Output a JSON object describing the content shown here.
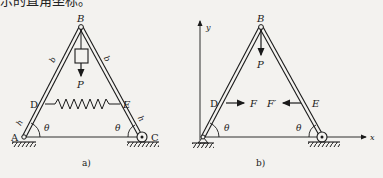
{
  "header_text": "示的直角坐标。",
  "figure_a": {
    "caption": "a)",
    "points": {
      "A": "A",
      "B": "B",
      "C": "C",
      "D": "D",
      "E": "E"
    },
    "bar_length_upper": "b",
    "bar_length_lower": "h",
    "angle": "θ",
    "load": "P"
  },
  "figure_b": {
    "caption": "b)",
    "points": {
      "B": "B",
      "D": "D",
      "E": "E"
    },
    "axis_x": "x",
    "axis_y": "y",
    "angle": "θ",
    "load": "P",
    "force_left": "F",
    "force_right": "F′"
  },
  "colors": {
    "ink": "#1a1a1a",
    "paper": "#f3f2ef"
  }
}
